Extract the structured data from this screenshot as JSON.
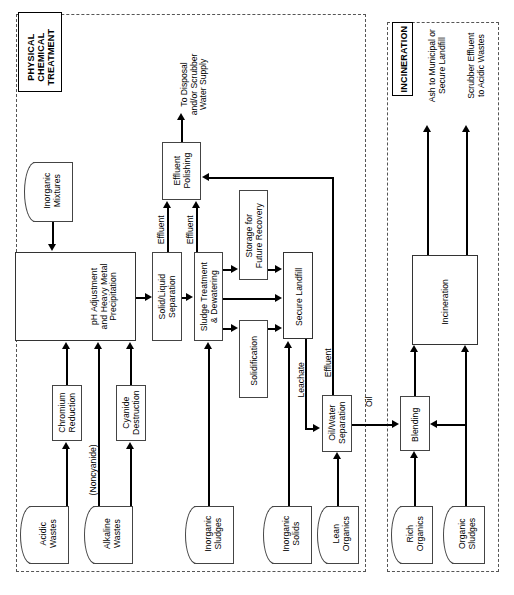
{
  "diagram": {
    "orientation": "rotated-90-ccw",
    "panels": [
      {
        "id": "physical_chemical",
        "title": "PHYSICAL\nCHEMICAL\nTREATMENT"
      },
      {
        "id": "incineration",
        "title": "INCINERATION"
      }
    ]
  },
  "physical_chemical": {
    "title": "PHYSICAL\nCHEMICAL\nTREATMENT",
    "sources": {
      "inorganic_mixtures": "Inorganic\nMixtures",
      "acidic_wastes": "Acidic\nWastes",
      "alkaline_wastes": "Alkaline\nWastes",
      "inorganic_sludges": "Inorganic\nSludges",
      "inorganic_solids": "Inorganic\nSolids",
      "lean_organics": "Lean\nOrganics"
    },
    "processes": {
      "ph_adjustment": "pH Adjustment\nand Heavy Metal\nPrecipitation",
      "chromium_reduction": "Chromium\nReduction",
      "cyanide_destruction": "Cyanide\nDestruction",
      "solid_liquid_separation": "Solid/Liquid\nSeparation",
      "sludge_treatment": "Sludge Treatment\n& Dewatering",
      "effluent_polishing": "Effluent\nPolishing",
      "storage_future_recovery": "Storage for\nFuture Recovery",
      "solidification": "Solidification",
      "secure_landfill": "Secure Landfill",
      "oil_water_separation": "Oil/Water\nSeparation"
    },
    "flow_labels": {
      "to_disposal": "To Disposal\nand/or Scrubber\nWater Supply",
      "effluent_a": "Effluent",
      "effluent_b": "Effluent",
      "noncyanide": "(Noncyanide)",
      "leachate": "Leachate",
      "effluent_c": "Effluent",
      "oil": "Oil"
    }
  },
  "incineration": {
    "title": "INCINERATION",
    "sources": {
      "rich_organics": "Rich\nOrganics",
      "organic_sludges": "Organic\nSludges"
    },
    "processes": {
      "blending": "Blending",
      "incineration": "Incineration"
    },
    "flow_labels": {
      "ash_out": "Ash to Municipal or\nSecure Landfill",
      "scrubber_out": "Scrubber Effluent\nto Acidic Wastes"
    }
  },
  "colors": {
    "line": "#000000",
    "box_border": "#444444",
    "panel_border": "#555555",
    "background": "#ffffff"
  }
}
